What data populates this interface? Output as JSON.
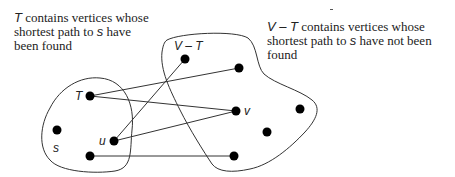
{
  "captions": {
    "left": {
      "var": "T",
      "text1": " contains vertices whose shortest path to ",
      "var2": "s",
      "text2": " have been found"
    },
    "right": {
      "var": "V – T",
      "text1": " contains vertices whose shortest path to ",
      "var2": "s",
      "text2": " have not been found"
    }
  },
  "regions": [
    {
      "name": "T",
      "label": "T"
    },
    {
      "name": "V-T",
      "label": "V – T"
    }
  ],
  "nodes": [
    {
      "id": "t",
      "label": "T",
      "x": 90,
      "y": 96,
      "set": "T"
    },
    {
      "id": "s",
      "label": "s",
      "x": 57,
      "y": 130,
      "set": "T"
    },
    {
      "id": "u",
      "label": "u",
      "x": 114,
      "y": 141,
      "set": "T"
    },
    {
      "id": "t4",
      "label": "",
      "x": 90,
      "y": 156,
      "set": "T"
    },
    {
      "id": "a",
      "label": "",
      "x": 185,
      "y": 59,
      "set": "V-T"
    },
    {
      "id": "b",
      "label": "",
      "x": 239,
      "y": 68,
      "set": "V-T"
    },
    {
      "id": "v",
      "label": "v",
      "x": 236,
      "y": 111,
      "set": "V-T"
    },
    {
      "id": "c",
      "label": "",
      "x": 300,
      "y": 109,
      "set": "V-T"
    },
    {
      "id": "d",
      "label": "",
      "x": 267,
      "y": 132,
      "set": "V-T"
    },
    {
      "id": "e",
      "label": "",
      "x": 234,
      "y": 156,
      "set": "V-T"
    }
  ],
  "edges": [
    {
      "from": "t",
      "to": "b"
    },
    {
      "from": "t",
      "to": "v"
    },
    {
      "from": "u",
      "to": "a"
    },
    {
      "from": "u",
      "to": "v"
    },
    {
      "from": "t4",
      "to": "e"
    }
  ],
  "labels": {
    "region_vt": "V – T",
    "node_t": "T",
    "node_s": "s",
    "node_u": "u",
    "node_v": "v"
  },
  "colors": {
    "stroke": "#333333",
    "node": "#000000",
    "text": "#222222"
  }
}
